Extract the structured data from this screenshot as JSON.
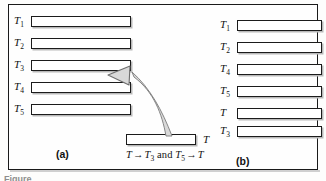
{
  "figure": {
    "panel_a": {
      "caption": "(a)",
      "rows": [
        {
          "label": "T",
          "sub": "1"
        },
        {
          "label": "T",
          "sub": "2"
        },
        {
          "label": "T",
          "sub": "3"
        },
        {
          "label": "T",
          "sub": "4"
        },
        {
          "label": "T",
          "sub": "5"
        }
      ]
    },
    "panel_b": {
      "caption": "(b)",
      "rows": [
        {
          "label": "T",
          "sub": "1"
        },
        {
          "label": "T",
          "sub": "2"
        },
        {
          "label": "T",
          "sub": "4"
        },
        {
          "label": "T",
          "sub": "5"
        },
        {
          "label": "T",
          "sub": ""
        },
        {
          "label": "T",
          "sub": "3"
        }
      ]
    },
    "center": {
      "bar_label": "T",
      "formula": {
        "lhs": "T",
        "arrow1": "→",
        "lhs_target": "T",
        "lhs_target_sub": "3",
        "conjunction": "and",
        "rhs": "T",
        "rhs_sub": "5",
        "arrow2": "→",
        "rhs_target": "T"
      }
    },
    "bottom_caption": "Figure",
    "colors": {
      "ink": "#1b1b1b",
      "bar_fill": "#ffffff",
      "bar_shadow": "#b9b9b9",
      "arrow_fill": "#d9d9d9",
      "arrow_stroke": "#6e6e6e",
      "background": "#fdfdfc"
    }
  }
}
